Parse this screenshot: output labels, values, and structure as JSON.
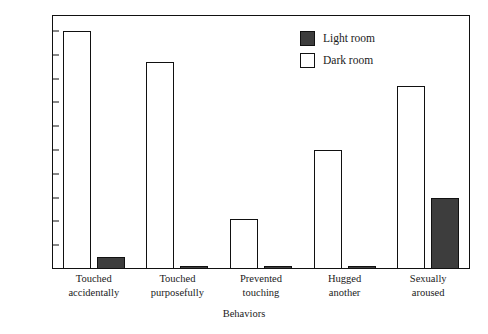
{
  "chart_data": {
    "type": "bar",
    "title": "",
    "xlabel": "Behaviors",
    "ylabel": "",
    "ylim": [
      0,
      100
    ],
    "ytick_labels": [
      "100%",
      "90%",
      "80%",
      "70%",
      "60%",
      "50%",
      "40%",
      "30%",
      "20%",
      "10%",
      "0%"
    ],
    "ytick_values": [
      100,
      90,
      80,
      70,
      60,
      50,
      40,
      30,
      20,
      10,
      0
    ],
    "grid": false,
    "legend_position": "top-right",
    "categories": [
      "Touched accidentally",
      "Touched purposefully",
      "Prevented touching",
      "Hugged another",
      "Sexually aroused"
    ],
    "category_lines": [
      [
        "Touched",
        "accidentally"
      ],
      [
        "Touched",
        "purposefully"
      ],
      [
        "Prevented",
        "touching"
      ],
      [
        "Hugged",
        "another"
      ],
      [
        "Sexually",
        "aroused"
      ]
    ],
    "series": [
      {
        "name": "Dark room",
        "color": "#ffffff",
        "values": [
          100,
          87,
          21,
          50,
          77
        ]
      },
      {
        "name": "Light room",
        "color": "#3d3d3d",
        "values": [
          5,
          1,
          1,
          1,
          30
        ]
      }
    ]
  },
  "legend": {
    "items": [
      {
        "label": "Light room",
        "swatch": "light-room"
      },
      {
        "label": "Dark room",
        "swatch": "dark-room"
      }
    ]
  }
}
